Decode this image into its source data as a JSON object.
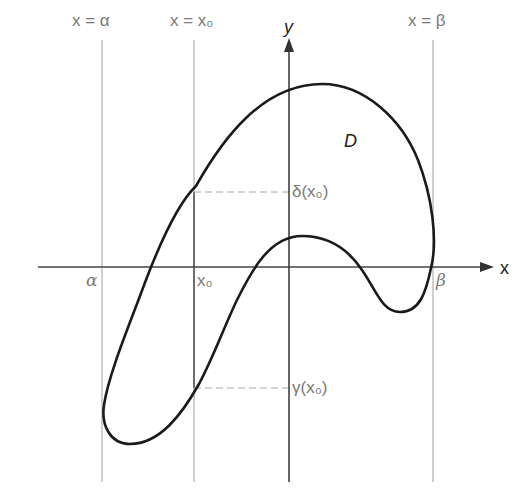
{
  "diagram": {
    "type": "region-between-curves",
    "colors": {
      "curve": "#1a1a1a",
      "axes": "#333333",
      "guides": "#9a9a9a",
      "labels": "#7a7a7a"
    },
    "axes": {
      "x_label": "x",
      "y_label": "y"
    },
    "vertical_lines": [
      {
        "id": "alpha",
        "label": "x = α"
      },
      {
        "id": "x0",
        "label": "x = x₀"
      },
      {
        "id": "beta",
        "label": "x = β"
      }
    ],
    "x_axis_ticks": {
      "alpha": "α",
      "x0": "x₀",
      "beta": "β"
    },
    "region_label": "D",
    "upper_bound_label": "δ(x₀)",
    "lower_bound_label": "γ(x₀)"
  }
}
